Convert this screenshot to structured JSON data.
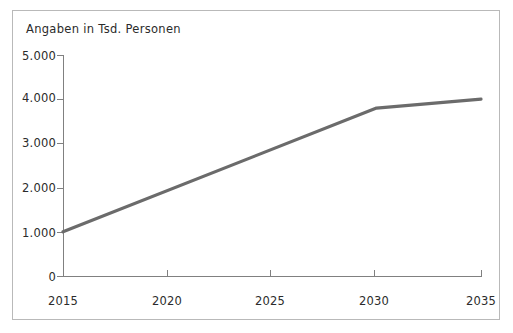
{
  "chart_data": {
    "type": "line",
    "title": "Angaben in Tsd. Personen",
    "xlabel": "",
    "ylabel": "",
    "x": [
      2015,
      2020,
      2025,
      2030,
      2035
    ],
    "series": [
      {
        "name": "Personen",
        "values": [
          1000,
          1870,
          2730,
          3800,
          4000
        ]
      }
    ],
    "vertices": [
      {
        "x": 2015,
        "y": 1000
      },
      {
        "x": 2030,
        "y": 3800
      },
      {
        "x": 2035,
        "y": 4000
      }
    ],
    "xlim": [
      2015,
      2035
    ],
    "ylim": [
      0,
      5000
    ],
    "xticks": [
      2015,
      2020,
      2025,
      2030,
      2035
    ],
    "xtick_labels": [
      "2015",
      "2020",
      "2025",
      "2030",
      "2035"
    ],
    "yticks": [
      0,
      1000,
      2000,
      3000,
      4000,
      5000
    ],
    "ytick_labels": [
      "0",
      "1.000",
      "2.000",
      "3.000",
      "4.000",
      "5.000"
    ],
    "grid": false,
    "legend": "none",
    "line_color": "#6b6b6b",
    "axis_color": "#808080",
    "frame_color": "#b9b9b9",
    "text_color": "#2b2b2b"
  }
}
